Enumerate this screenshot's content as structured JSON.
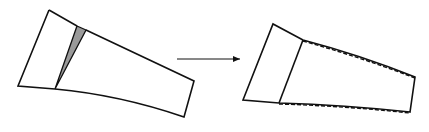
{
  "diagram": {
    "colors": {
      "stroke": "#111111",
      "wedge_fill": "#9a9a9a",
      "background": "#ffffff"
    },
    "left_shape": {
      "label": "",
      "outline": "49,10 18,86 55,89 120,100 184,117 194,81 86,30",
      "split_line": "77,26 55,89",
      "wedge": "77,26 86,30 55,89"
    },
    "arrow": {
      "x1": 177,
      "y1": 59,
      "x2": 241,
      "y2": 59
    },
    "right_shape": {
      "label": "",
      "outline": "273,24 243,100 279,103 345,106 410,112 415,77 303,40",
      "split_line": "303,40 279,103",
      "dashed_top": "303,40 360,58 415,77",
      "dashed_bottom": "279,104 345,108 410,113"
    }
  }
}
